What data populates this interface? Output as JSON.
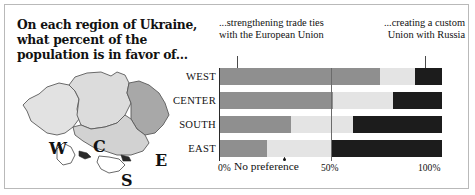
{
  "title": "On each region of Ukraine, what percent of the population is in favor of...",
  "annotations": {
    "left": "...strengthening trade ties with the European Union",
    "right": "...creating a custom Union with Russia",
    "middle": "No preference"
  },
  "map": {
    "regions": [
      {
        "code": "W",
        "name": "West",
        "fill": "#e2e2e2"
      },
      {
        "code": "C",
        "name": "Center",
        "fill": "#dcdcdc"
      },
      {
        "code": "S",
        "name": "South",
        "fill": "#d2d2d2"
      },
      {
        "code": "E",
        "name": "East",
        "fill": "#a8a8a8"
      }
    ]
  },
  "chart_data": {
    "type": "bar",
    "orientation": "horizontal",
    "stacked": true,
    "title": "On each region of Ukraine, what percent of the population is in favor of...",
    "xlabel": "",
    "ylabel": "",
    "xlim": [
      0,
      100
    ],
    "grid": true,
    "legend_position": "annotations",
    "categories": [
      "WEST",
      "CENTER",
      "SOUTH",
      "EAST"
    ],
    "series": [
      {
        "name": "...strengthening trade ties with the European Union",
        "color": "#8f8f8f",
        "values": [
          72,
          51,
          32,
          21
        ]
      },
      {
        "name": "No preference",
        "color": "#e4e4e4",
        "values": [
          16,
          27,
          28,
          29
        ]
      },
      {
        "name": "...creating a custom Union with Russia",
        "color": "#1c1c1c",
        "values": [
          12,
          22,
          40,
          50
        ]
      }
    ],
    "xticks": [
      0,
      50,
      100
    ],
    "xticklabels": [
      "0%",
      "50%",
      "100%"
    ]
  },
  "axis": {
    "ticks": [
      {
        "label": "0%",
        "value": 0
      },
      {
        "label": "50%",
        "value": 50
      },
      {
        "label": "100%",
        "value": 100
      }
    ]
  }
}
